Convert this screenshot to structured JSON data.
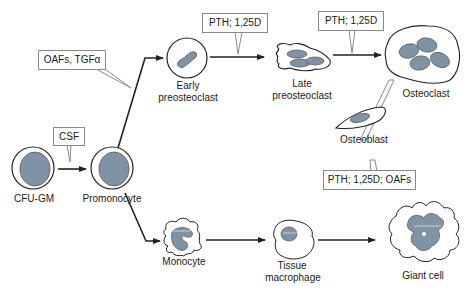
{
  "diagram": {
    "colors": {
      "nucleus": "#7f93a5",
      "stroke": "#222222",
      "box_border": "#8a8a8a"
    },
    "cells": {
      "cfu_gm": {
        "label": "CFU-GM"
      },
      "promonocyte": {
        "label": "Promonocyte"
      },
      "early_preosteoclast": {
        "label_line1": "Early",
        "label_line2": "preosteoclast"
      },
      "late_preosteoclast": {
        "label_line1": "Late",
        "label_line2": "preosteoclast"
      },
      "osteoclast": {
        "label": "Osteoclast"
      },
      "osteoblast": {
        "label": "Osteoblast"
      },
      "monocyte": {
        "label": "Monocyte"
      },
      "tissue_macrophage": {
        "label_line1": "Tissue",
        "label_line2": "macrophage"
      },
      "giant_cell": {
        "label": "Giant cell"
      }
    },
    "factors": {
      "csf": "CSF",
      "oafs_tgfa": "OAFs, TGFα",
      "pth_125d_1": "PTH; 1,25D",
      "pth_125d_2": "PTH; 1,25D",
      "pth_125d_oafs": "PTH; 1,25D; OAFs"
    }
  }
}
